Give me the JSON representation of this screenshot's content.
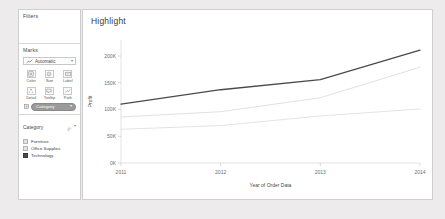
{
  "sidebar": {
    "filters": {
      "title": "Filters"
    },
    "marks": {
      "title": "Marks",
      "mark_type": {
        "value": "Automatic",
        "icon": "line-mark-icon",
        "caret": "▾"
      },
      "buttons": [
        {
          "label": "Color",
          "icon": "color-icon"
        },
        {
          "label": "Size",
          "icon": "size-icon"
        },
        {
          "label": "Label",
          "icon": "label-icon"
        },
        {
          "label": "Detail",
          "icon": "detail-icon"
        },
        {
          "label": "Tooltip",
          "icon": "tooltip-icon"
        },
        {
          "label": "Path",
          "icon": "path-icon"
        }
      ],
      "pills": [
        {
          "label": "Category",
          "icon": "color-pill-icon",
          "caret": "▾",
          "color": "#9a9a9a"
        }
      ]
    },
    "legend": {
      "title": "Category",
      "tools": [
        {
          "icon": "legend-sort-icon"
        },
        {
          "icon": "chevron-down-icon",
          "glyph": "▾"
        }
      ],
      "items": [
        {
          "label": "Furniture",
          "color": "#e2e2e2",
          "selected": false
        },
        {
          "label": "Office Supplies",
          "color": "#e2e2e2",
          "selected": false
        },
        {
          "label": "Technology",
          "color": "#4a4a4a",
          "selected": true
        }
      ]
    }
  },
  "chart_panel": {
    "title": "Highlight"
  },
  "chart_data": {
    "type": "line",
    "title": "Highlight",
    "xlabel": "Year of Order Data",
    "ylabel": "Profit",
    "x": [
      "2011",
      "2012",
      "2013",
      "2014"
    ],
    "xtick_labels": [
      "2011",
      "2012",
      "2013",
      "2014"
    ],
    "ytick_labels": [
      "0K",
      "50K",
      "100K",
      "150K",
      "200K"
    ],
    "ytick_values": [
      0,
      50000,
      100000,
      150000,
      200000
    ],
    "ylim": [
      0,
      230000
    ],
    "grid": false,
    "legend_position": "left-panel",
    "series": [
      {
        "name": "Technology",
        "values": [
          110000,
          137000,
          156000,
          211000
        ],
        "color": "#4a4a4a",
        "width": 1.3,
        "highlighted": true
      },
      {
        "name": "Office Supplies",
        "values": [
          86000,
          96000,
          122000,
          179000
        ],
        "color": "#dcdcdc",
        "width": 0.9,
        "highlighted": false
      },
      {
        "name": "Furniture",
        "values": [
          63000,
          70000,
          88000,
          101000
        ],
        "color": "#e0e0e0",
        "width": 0.9,
        "highlighted": false
      }
    ]
  }
}
